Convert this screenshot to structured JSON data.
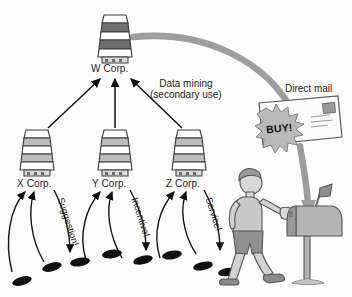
{
  "diagram": {
    "title_visible": false,
    "background_color": "#fdfdfd",
    "ink_color": "#1a1a1a",
    "gray_arrow_color": "#9a9a9a",
    "building_fill_light": "#ffffff",
    "building_fill_mid": "#bdbdbd",
    "building_fill_dark": "#6e6e6e",
    "nodes": {
      "top": {
        "label": "W Corp.",
        "icon": "office-building-icon"
      },
      "bottom": [
        {
          "label": "X Corp.",
          "icon": "office-building-icon"
        },
        {
          "label": "Y Corp.",
          "icon": "office-building-icon"
        },
        {
          "label": "Z Corp.",
          "icon": "office-building-icon"
        }
      ]
    },
    "annotations": {
      "data_mining_line1": "Data mining",
      "data_mining_line2": "(secondary use)",
      "direct_mail": "Direct mail",
      "buy": "BUY!"
    },
    "channel_labels": [
      {
        "text": "Suggestion!",
        "rotation_deg": 72
      },
      {
        "text": "Incentive!",
        "rotation_deg": 72
      },
      {
        "text": "Service!",
        "rotation_deg": 72
      }
    ],
    "figures": {
      "person": {
        "name": "walking-person",
        "shirt_color": "#c8c8c8",
        "shorts_color": "#8f8f8f",
        "skin_color": "#d8d8d8"
      },
      "mailbox": {
        "name": "mailbox",
        "flag_up": true,
        "body_color": "#b5b5b5"
      },
      "envelope": {
        "name": "direct-mail-envelope",
        "body_color": "#fbfbfb",
        "burst_color": "#b9b9b9"
      },
      "footprints": {
        "name": "footprints-trail",
        "count": 9,
        "color": "#111111"
      }
    }
  }
}
